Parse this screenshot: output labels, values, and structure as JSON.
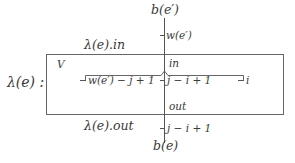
{
  "diagram": {
    "outer_label": "λ(e) :",
    "box_label": "V",
    "top_node": "b(e′)",
    "bottom_node": "b(e)",
    "in_edge_label": "λ(e).in",
    "out_edge_label": "λ(e).out",
    "in_port": "in",
    "out_port": "out",
    "top_weight": "w(e′)",
    "bottom_weight": "j − i + 1",
    "inner_ticks": [
      {
        "label": "w(e′) − j + 1"
      },
      {
        "label": "j − i + 1"
      },
      {
        "label": "i"
      }
    ]
  },
  "colors": {
    "line": "#555555",
    "text": "#3a3a3a",
    "background": "#ffffff"
  }
}
